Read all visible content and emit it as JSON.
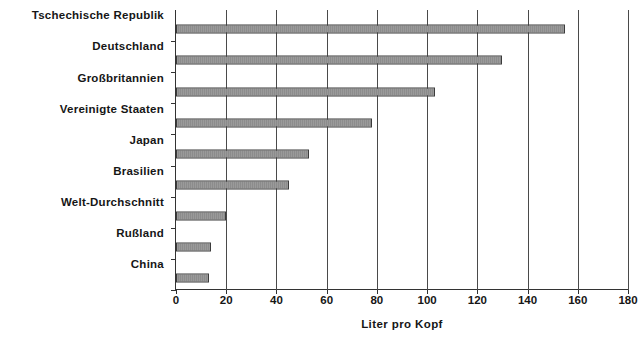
{
  "chart_data": {
    "type": "bar",
    "orientation": "horizontal",
    "title": "",
    "xlabel": "Liter pro Kopf",
    "ylabel": "",
    "categories": [
      "Tschechische Republik",
      "Deutschland",
      "Großbritannien",
      "Vereinigte Staaten",
      "Japan",
      "Brasilien",
      "Welt-Durchschnitt",
      "Rußland",
      "China"
    ],
    "values": [
      155,
      130,
      103,
      78,
      53,
      45,
      20,
      14,
      13
    ],
    "xlim": [
      0,
      180
    ],
    "xticks": [
      0,
      20,
      40,
      60,
      80,
      100,
      120,
      140,
      160,
      180
    ],
    "xtick_labels": [
      "0",
      "20",
      "40",
      "60",
      "80",
      "100",
      "120",
      "140",
      "160",
      "180"
    ],
    "grid": "vertical",
    "legend": "none",
    "bar_color": "#9a9a9a",
    "bar_border_color": "#3b3b3b",
    "axis_color": "#333333"
  }
}
